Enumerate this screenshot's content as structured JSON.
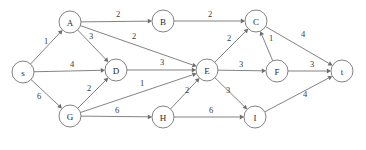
{
  "diagram": {
    "type": "flow-network",
    "colors": {
      "stroke": "#6d6d6d",
      "node_fill": "#ffffff",
      "label": "#2b2b2b",
      "background": "#ffffff"
    },
    "node_radius": 11,
    "nodes": [
      {
        "id": "s",
        "label": "s",
        "x": 23,
        "y": 72
      },
      {
        "id": "A",
        "label": "A",
        "x": 70,
        "y": 22
      },
      {
        "id": "B",
        "label": "B",
        "x": 163,
        "y": 21
      },
      {
        "id": "C",
        "label": "C",
        "x": 256,
        "y": 21
      },
      {
        "id": "D",
        "label": "D",
        "x": 116,
        "y": 70
      },
      {
        "id": "E",
        "label": "E",
        "x": 207,
        "y": 70
      },
      {
        "id": "F",
        "label": "F",
        "x": 277,
        "y": 71
      },
      {
        "id": "G",
        "label": "G",
        "x": 70,
        "y": 116
      },
      {
        "id": "H",
        "label": "H",
        "x": 163,
        "y": 117
      },
      {
        "id": "I",
        "label": "I",
        "x": 255,
        "y": 117
      },
      {
        "id": "t",
        "label": "t",
        "x": 342,
        "y": 71
      }
    ],
    "edges": [
      {
        "from": "s",
        "to": "A",
        "weight": "1",
        "lx": 46,
        "ly": 41
      },
      {
        "from": "s",
        "to": "D",
        "weight": "4",
        "lx": 72,
        "ly": 64
      },
      {
        "from": "s",
        "to": "G",
        "weight": "6",
        "lx": 39,
        "ly": 96
      },
      {
        "from": "A",
        "to": "B",
        "weight": "2",
        "lx": 118,
        "ly": 14
      },
      {
        "from": "A",
        "to": "D",
        "weight": "3",
        "lx": 91,
        "ly": 36
      },
      {
        "from": "A",
        "to": "E",
        "weight": "2",
        "lx": 134,
        "ly": 36
      },
      {
        "from": "B",
        "to": "C",
        "weight": "2",
        "lx": 210,
        "ly": 14
      },
      {
        "from": "C",
        "to": "t",
        "weight": "4",
        "lx": 303,
        "ly": 34
      },
      {
        "from": "D",
        "to": "E",
        "weight": "3",
        "lx": 162,
        "ly": 62
      },
      {
        "from": "G",
        "to": "D",
        "weight": "2",
        "lx": 89,
        "ly": 88
      },
      {
        "from": "G",
        "to": "E",
        "weight": "1",
        "lx": 142,
        "ly": 83
      },
      {
        "from": "G",
        "to": "H",
        "weight": "6",
        "lx": 117,
        "ly": 110
      },
      {
        "from": "H",
        "to": "I",
        "weight": "6",
        "lx": 211,
        "ly": 110
      },
      {
        "from": "H",
        "to": "E",
        "weight": "2",
        "lx": 187,
        "ly": 90
      },
      {
        "from": "E",
        "to": "C",
        "weight": "2",
        "lx": 229,
        "ly": 38
      },
      {
        "from": "E",
        "to": "F",
        "weight": "3",
        "lx": 241,
        "ly": 64
      },
      {
        "from": "E",
        "to": "I",
        "weight": "3",
        "lx": 228,
        "ly": 90
      },
      {
        "from": "F",
        "to": "C",
        "weight": "1",
        "lx": 271,
        "ly": 38
      },
      {
        "from": "F",
        "to": "t",
        "weight": "3",
        "lx": 312,
        "ly": 64
      },
      {
        "from": "I",
        "to": "t",
        "weight": "4",
        "lx": 305,
        "ly": 94
      }
    ]
  }
}
